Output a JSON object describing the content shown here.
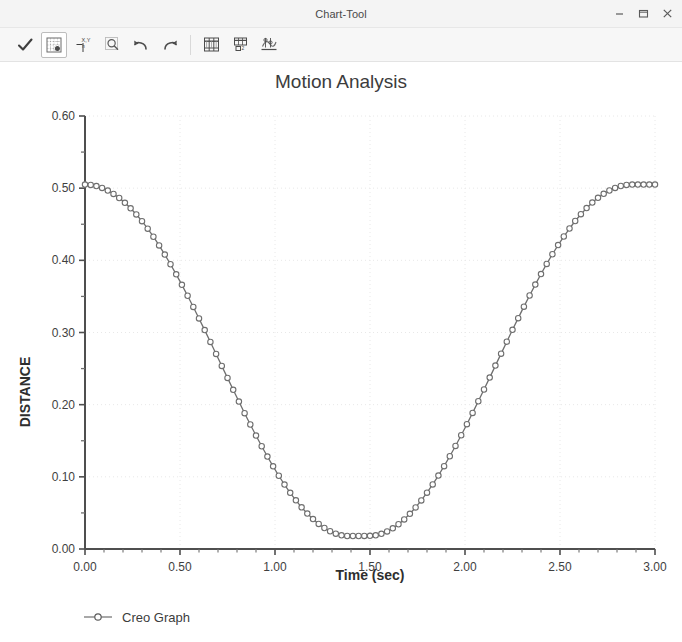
{
  "window": {
    "title": "Chart-Tool",
    "controls": [
      {
        "name": "minimize-button",
        "glyph": "minimize"
      },
      {
        "name": "maximize-button",
        "glyph": "maximize"
      },
      {
        "name": "close-button",
        "glyph": "close"
      }
    ]
  },
  "toolbar": {
    "items": [
      {
        "name": "accept-check-button",
        "icon": "checkmark-icon",
        "label": "Accept",
        "selected": false
      },
      {
        "name": "grid-settings-button",
        "icon": "grid-icon",
        "label": "Grid",
        "selected": true
      },
      {
        "name": "xy-axis-button",
        "icon": "xy-axis-icon",
        "label": "X,Y Axis",
        "selected": false
      },
      {
        "name": "zoom-button",
        "icon": "magnifier-icon",
        "label": "Zoom",
        "selected": false
      },
      {
        "name": "undo-button",
        "icon": "undo-arrow-icon",
        "label": "Undo",
        "selected": false
      },
      {
        "name": "redo-button",
        "icon": "redo-arrow-icon",
        "label": "Redo",
        "selected": false
      },
      {
        "name": "table-view-button",
        "icon": "table-icon",
        "label": "Table",
        "selected": false
      },
      {
        "name": "export-data-button",
        "icon": "export-table-icon",
        "label": "Export",
        "selected": false
      },
      {
        "name": "graph-settings-button",
        "icon": "graph-settings-icon",
        "label": "Settings",
        "selected": false
      }
    ]
  },
  "chart_data": {
    "type": "line",
    "title": "Motion Analysis",
    "xlabel": "Time (sec)",
    "ylabel": "DISTANCE",
    "xlim": [
      0.0,
      3.0
    ],
    "ylim": [
      0.0,
      0.6
    ],
    "xticks": [
      0.0,
      0.5,
      1.0,
      1.5,
      2.0,
      2.5,
      3.0
    ],
    "xtick_labels": [
      "0.00",
      "0.50",
      "1.00",
      "1.50",
      "2.00",
      "2.50",
      "3.00"
    ],
    "yticks": [
      0.0,
      0.1,
      0.2,
      0.3,
      0.4,
      0.5,
      0.6
    ],
    "ytick_labels": [
      "0.00",
      "0.10",
      "0.20",
      "0.30",
      "0.40",
      "0.50",
      "0.60"
    ],
    "x_minor_tick_step": 0.1,
    "y_minor_tick_step": 0.05,
    "grid": true,
    "grid_style": "dotted",
    "grid_color": "#e8e8e8",
    "legend_position": "bottom-left",
    "marker": "open-circle",
    "line_color": "#6e6e6e",
    "marker_color": "#6e6e6e",
    "series": [
      {
        "name": "Creo Graph",
        "x": [
          0.0,
          0.03,
          0.06,
          0.09,
          0.12,
          0.15,
          0.18,
          0.21,
          0.24,
          0.27,
          0.3,
          0.33,
          0.36,
          0.39,
          0.42,
          0.45,
          0.48,
          0.51,
          0.54,
          0.57,
          0.6,
          0.63,
          0.66,
          0.69,
          0.72,
          0.75,
          0.78,
          0.81,
          0.84,
          0.87,
          0.9,
          0.93,
          0.96,
          0.99,
          1.02,
          1.05,
          1.08,
          1.11,
          1.14,
          1.17,
          1.2,
          1.23,
          1.26,
          1.29,
          1.32,
          1.35,
          1.38,
          1.41,
          1.44,
          1.47,
          1.5,
          1.53,
          1.56,
          1.59,
          1.62,
          1.65,
          1.68,
          1.71,
          1.74,
          1.77,
          1.8,
          1.83,
          1.86,
          1.89,
          1.92,
          1.95,
          1.98,
          2.01,
          2.04,
          2.07,
          2.1,
          2.13,
          2.16,
          2.19,
          2.22,
          2.25,
          2.28,
          2.31,
          2.34,
          2.37,
          2.4,
          2.43,
          2.46,
          2.49,
          2.52,
          2.55,
          2.58,
          2.61,
          2.64,
          2.67,
          2.7,
          2.73,
          2.76,
          2.79,
          2.82,
          2.85,
          2.88,
          2.91,
          2.94,
          2.97,
          3.0
        ],
        "y": [
          0.505,
          0.5045,
          0.5029,
          0.5003,
          0.4967,
          0.492,
          0.4864,
          0.4797,
          0.4721,
          0.4636,
          0.4542,
          0.4438,
          0.4327,
          0.4207,
          0.408,
          0.3946,
          0.3806,
          0.366,
          0.3509,
          0.3354,
          0.3195,
          0.3033,
          0.2869,
          0.2703,
          0.2537,
          0.2371,
          0.2206,
          0.2043,
          0.1882,
          0.1725,
          0.1572,
          0.1424,
          0.1281,
          0.1145,
          0.1015,
          0.0893,
          0.0779,
          0.0674,
          0.0578,
          0.0491,
          0.0414,
          0.0347,
          0.0291,
          0.0246,
          0.0212,
          0.019,
          0.018,
          0.018,
          0.018,
          0.0181,
          0.0183,
          0.019,
          0.021,
          0.0243,
          0.0287,
          0.0343,
          0.041,
          0.0488,
          0.0576,
          0.0673,
          0.078,
          0.0895,
          0.1018,
          0.1148,
          0.1285,
          0.1428,
          0.1576,
          0.1729,
          0.1886,
          0.2047,
          0.221,
          0.2375,
          0.2541,
          0.2707,
          0.2873,
          0.3037,
          0.3199,
          0.3358,
          0.3513,
          0.3664,
          0.381,
          0.395,
          0.4084,
          0.4211,
          0.433,
          0.4441,
          0.4545,
          0.4639,
          0.4724,
          0.48,
          0.4866,
          0.4922,
          0.4968,
          0.5004,
          0.503,
          0.5045,
          0.505,
          0.505,
          0.505,
          0.505,
          0.505
        ]
      }
    ]
  }
}
